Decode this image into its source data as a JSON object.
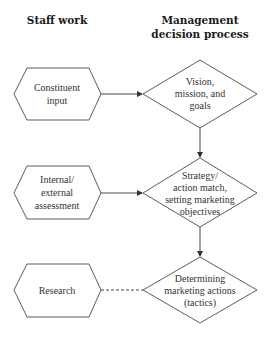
{
  "headers": {
    "staff_work": "Staff work",
    "management_line1": "Management",
    "management_line2": "decision process"
  },
  "staff_nodes": [
    {
      "shape": "hexagon",
      "lines": [
        "Constituent",
        "input"
      ]
    },
    {
      "shape": "hexagon",
      "lines": [
        "Internal/",
        "external",
        "assessment"
      ]
    },
    {
      "shape": "hexagon",
      "lines": [
        "Research"
      ]
    }
  ],
  "management_nodes": [
    {
      "shape": "diamond",
      "lines": [
        "Vision,",
        "mission, and",
        "goals"
      ]
    },
    {
      "shape": "diamond",
      "lines": [
        "Strategy/",
        "action match,",
        "setting marketing",
        "objectives"
      ]
    },
    {
      "shape": "diamond",
      "lines": [
        "Determining",
        "marketing actions",
        "(tactics)"
      ]
    }
  ],
  "connections": [
    {
      "from": "Constituent input",
      "to": "Vision, mission, and goals",
      "style": "solid-arrow"
    },
    {
      "from": "Internal/external assessment",
      "to": "Strategy/action match, setting marketing objectives",
      "style": "solid-arrow"
    },
    {
      "from": "Research",
      "to": "Determining marketing actions (tactics)",
      "style": "dashed"
    },
    {
      "from": "Vision, mission, and goals",
      "to": "Strategy/action match, setting marketing objectives",
      "style": "solid-arrow"
    },
    {
      "from": "Strategy/action match, setting marketing objectives",
      "to": "Determining marketing actions (tactics)",
      "style": "solid-arrow"
    }
  ],
  "colors": {
    "stroke": "#4a4a4a",
    "text": "#333333",
    "background": "#ffffff"
  }
}
